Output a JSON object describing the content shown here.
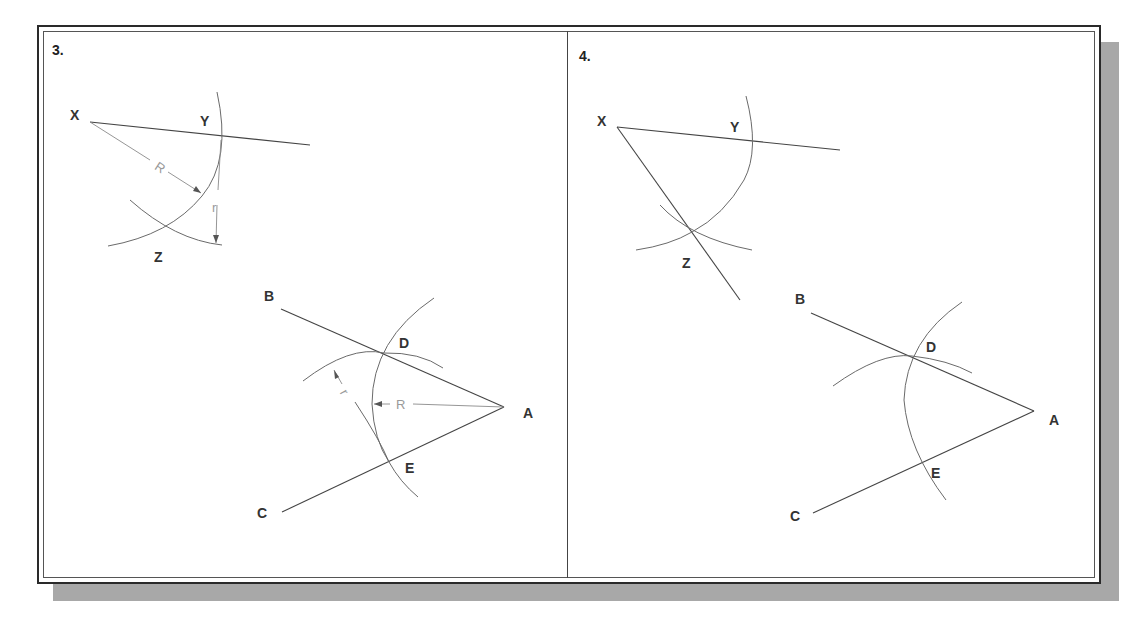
{
  "figure": {
    "panels": [
      {
        "number": "3.",
        "labels": {
          "X": "X",
          "Y": "Y",
          "Z": "Z",
          "A": "A",
          "B": "B",
          "C": "C",
          "D": "D",
          "E": "E"
        },
        "dimension_labels": {
          "R_upper": "R",
          "r_upper": "r",
          "R_lower": "R",
          "r_lower": "r"
        }
      },
      {
        "number": "4.",
        "labels": {
          "X": "X",
          "Y": "Y",
          "Z": "Z",
          "A": "A",
          "B": "B",
          "C": "C",
          "D": "D",
          "E": "E"
        }
      }
    ],
    "colors": {
      "line": "#444444",
      "arc": "#6a6a6a",
      "dimension": "#8a8a8a",
      "frame": "#2a2a2a",
      "shadow": "#a8a8a8",
      "background": "#ffffff"
    }
  }
}
